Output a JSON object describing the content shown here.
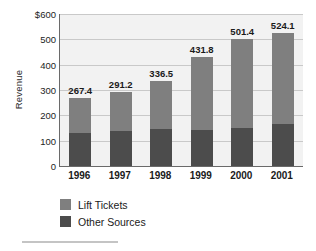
{
  "chart_data": {
    "type": "bar",
    "title": "",
    "subtitle": "",
    "xlabel": "",
    "ylabel": "Revenue",
    "categories": [
      "1996",
      "1997",
      "1998",
      "1999",
      "2000",
      "2001"
    ],
    "series": [
      {
        "name": "Lift Tickets",
        "color": "#7f7f7f",
        "values": [
          137.4,
          153.2,
          188.5,
          287.8,
          351.4,
          357.1
        ]
      },
      {
        "name": "Other Sources",
        "color": "#4c4c4c",
        "values": [
          130.0,
          138.0,
          148.0,
          144.0,
          150.0,
          167.0
        ]
      }
    ],
    "totals": [
      267.4,
      291.2,
      336.5,
      431.8,
      501.4,
      524.1
    ],
    "data_labels": [
      "267.4",
      "291.2",
      "336.5",
      "431.8",
      "501.4",
      "524.1"
    ],
    "ylim": [
      0,
      600
    ],
    "ytick_values": [
      0,
      100,
      200,
      300,
      400,
      500,
      600
    ],
    "ytick_labels": [
      "0",
      "100",
      "200",
      "300",
      "400",
      "500",
      "$600"
    ],
    "grid": true,
    "stacked": true,
    "legend_position": "bottom-left",
    "plot_background": "#f2f2f2",
    "gridline_color": "#c9c9c9",
    "axis_color": "#6a6a6a"
  },
  "legend": {
    "items": [
      {
        "label": "Lift Tickets",
        "color": "#7f7f7f"
      },
      {
        "label": "Other Sources",
        "color": "#4c4c4c"
      }
    ]
  }
}
